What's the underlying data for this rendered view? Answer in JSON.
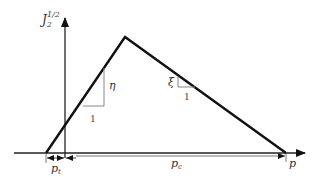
{
  "diagram": {
    "type": "yield-surface-sketch",
    "y_axis_label": "J",
    "y_axis_label_sub": "2",
    "y_axis_label_sup": "1/2",
    "x_axis_label": "p",
    "slope_left": {
      "symbol": "η",
      "run_label": "1"
    },
    "slope_right": {
      "symbol": "ξ",
      "run_label": "1"
    },
    "dimensions": [
      {
        "label": "p",
        "sub": "t"
      },
      {
        "label": "p",
        "sub": "c"
      }
    ],
    "colors": {
      "line": "#111111",
      "thin": "#777777",
      "text": "#333333"
    }
  }
}
